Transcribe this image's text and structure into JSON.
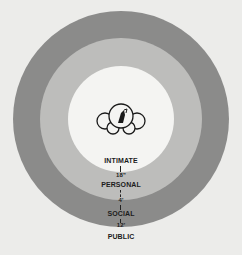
{
  "diagram": {
    "type": "concentric-zones",
    "colors": {
      "background": "#ececea",
      "public_ring": "#8b8b8a",
      "social_personal_ring": "#bdbdbb",
      "intimate_circle": "#f4f4f2",
      "text": "#1c1c1c"
    },
    "center_icon": "people-group-icon",
    "zones": [
      {
        "label": "INTIMATE"
      },
      {
        "label": "PERSONAL"
      },
      {
        "label": "SOCIAL"
      },
      {
        "label": "PUBLIC"
      }
    ],
    "distances": [
      {
        "label": "18\""
      },
      {
        "label": "4'"
      },
      {
        "label": "12'"
      }
    ]
  }
}
